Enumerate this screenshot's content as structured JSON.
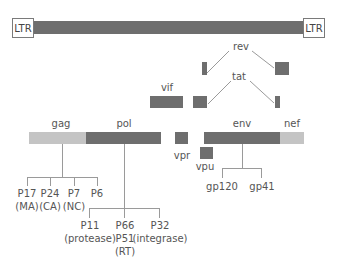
{
  "diagram": {
    "ltr_left": "LTR",
    "ltr_right": "LTR",
    "genes": {
      "rev": "rev",
      "tat": "tat",
      "vif": "vif",
      "gag": "gag",
      "pol": "pol",
      "vpr": "vpr",
      "vpu": "vpu",
      "env": "env",
      "nef": "nef"
    },
    "gag_products": [
      {
        "name": "P17",
        "sub": "(MA)"
      },
      {
        "name": "P24",
        "sub": "(CA)"
      },
      {
        "name": "P7",
        "sub": "(NC)"
      },
      {
        "name": "P6",
        "sub": ""
      }
    ],
    "pol_products": [
      {
        "name": "P11",
        "sub": "(protease)",
        "sub2": ""
      },
      {
        "name": "P66",
        "sub": "P51",
        "sub2": "(RT)"
      },
      {
        "name": "P32",
        "sub": "(integrase)",
        "sub2": ""
      }
    ],
    "env_products": [
      {
        "name": "gp120"
      },
      {
        "name": "gp41"
      }
    ],
    "colors": {
      "dark_segment": "#6e6e6e",
      "light_segment": "#c4c4c4",
      "connector": "#9a9a9a",
      "text": "#555555"
    }
  }
}
